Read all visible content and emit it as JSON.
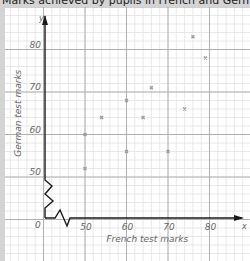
{
  "title": "Marks achieved by pupils in French and German test",
  "chart_data": {
    "type": "scatter",
    "title": "Marks achieved by pupils in French and German test",
    "xlabel": "French test marks",
    "ylabel": "German test marks",
    "x_axis_letter": "x",
    "y_axis_letter": "y",
    "origin_label": "0",
    "xticks": [
      50,
      60,
      70,
      80
    ],
    "yticks": [
      50,
      60,
      70,
      80
    ],
    "xlim": [
      0,
      90
    ],
    "ylim": [
      0,
      90
    ],
    "axis_breaks": true,
    "grid": true,
    "points": [
      {
        "x": 76,
        "y": 83
      },
      {
        "x": 79,
        "y": 78
      },
      {
        "x": 66,
        "y": 71
      },
      {
        "x": 60,
        "y": 68
      },
      {
        "x": 54,
        "y": 64
      },
      {
        "x": 64,
        "y": 64
      },
      {
        "x": 74,
        "y": 66
      },
      {
        "x": 50,
        "y": 60
      },
      {
        "x": 60,
        "y": 56
      },
      {
        "x": 70,
        "y": 56
      },
      {
        "x": 50,
        "y": 52
      }
    ]
  },
  "colors": {
    "axis": "#1a1a1a",
    "grid_minor": "#e2e2e2",
    "grid_major": "#a8a8a8",
    "points": "#9a9a9a",
    "labels": "#666666",
    "frame": "#d4d4d4"
  }
}
